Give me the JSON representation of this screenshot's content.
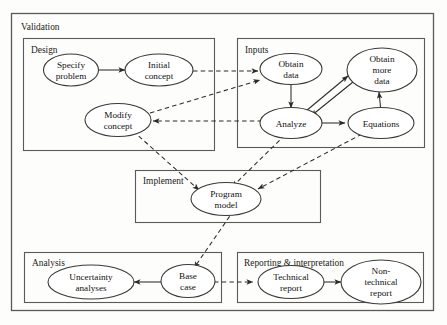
{
  "diagram": {
    "title": "Validation",
    "outer_group": {
      "label": "Validation"
    },
    "groups": [
      {
        "id": "design",
        "label": "Design"
      },
      {
        "id": "inputs",
        "label": "Inputs"
      },
      {
        "id": "implement",
        "label": "Implement"
      },
      {
        "id": "analysis",
        "label": "Analysis"
      },
      {
        "id": "reporting",
        "label": "Reporting & interpretation"
      }
    ],
    "nodes": [
      {
        "id": "specify_problem",
        "group": "design",
        "lines": [
          "Specify",
          "problem"
        ]
      },
      {
        "id": "initial_concept",
        "group": "design",
        "lines": [
          "Initial",
          "concept"
        ]
      },
      {
        "id": "modify_concept",
        "group": "design",
        "lines": [
          "Modify",
          "concept"
        ]
      },
      {
        "id": "obtain_data",
        "group": "inputs",
        "lines": [
          "Obtain",
          "data"
        ]
      },
      {
        "id": "obtain_more_data",
        "group": "inputs",
        "lines": [
          "Obtain",
          "more",
          "data"
        ]
      },
      {
        "id": "analyze",
        "group": "inputs",
        "lines": [
          "Analyze"
        ]
      },
      {
        "id": "equations",
        "group": "inputs",
        "lines": [
          "Equations"
        ]
      },
      {
        "id": "program_model",
        "group": "implement",
        "lines": [
          "Program",
          "model"
        ]
      },
      {
        "id": "uncertainty",
        "group": "analysis",
        "lines": [
          "Uncertainty",
          "analyses"
        ]
      },
      {
        "id": "base_case",
        "group": "analysis",
        "lines": [
          "Base",
          "case"
        ]
      },
      {
        "id": "technical_report",
        "group": "reporting",
        "lines": [
          "Technical",
          "report"
        ]
      },
      {
        "id": "nontech_report",
        "group": "reporting",
        "lines": [
          "Non-",
          "technical",
          "report"
        ]
      }
    ],
    "edges": [
      {
        "from": "specify_problem",
        "to": "initial_concept",
        "style": "solid"
      },
      {
        "from": "initial_concept",
        "to": "obtain_data",
        "style": "dashed"
      },
      {
        "from": "obtain_data",
        "to": "analyze",
        "style": "solid"
      },
      {
        "from": "analyze",
        "to": "obtain_more_data",
        "style": "solid"
      },
      {
        "from": "obtain_more_data",
        "to": "analyze",
        "style": "solid"
      },
      {
        "from": "analyze",
        "to": "equations",
        "style": "solid"
      },
      {
        "from": "equations",
        "to": "obtain_more_data",
        "style": "solid"
      },
      {
        "from": "analyze",
        "to": "modify_concept",
        "style": "dashed"
      },
      {
        "from": "modify_concept",
        "to": "obtain_data",
        "style": "dashed"
      },
      {
        "from": "modify_concept",
        "to": "program_model",
        "style": "dashed"
      },
      {
        "from": "analyze",
        "to": "program_model",
        "style": "dashed"
      },
      {
        "from": "equations",
        "to": "program_model",
        "style": "dashed"
      },
      {
        "from": "program_model",
        "to": "base_case",
        "style": "dashed"
      },
      {
        "from": "base_case",
        "to": "uncertainty",
        "style": "solid"
      },
      {
        "from": "base_case",
        "to": "technical_report",
        "style": "dashed"
      },
      {
        "from": "technical_report",
        "to": "nontech_report",
        "style": "solid"
      }
    ],
    "colors": {
      "background": "#fdfdfc",
      "box_stroke": "#5a5a58",
      "node_stroke": "#3a3a38",
      "edge_stroke": "#2b2b29",
      "text": "#111111"
    }
  }
}
